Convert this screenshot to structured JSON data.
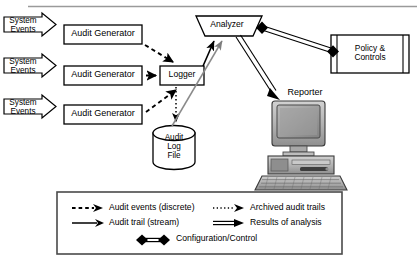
{
  "figure": {
    "type": "block-diagram"
  },
  "nodes": {
    "system_events": [
      {
        "label": "System\nEvents",
        "shape": "arrow-pentagon"
      },
      {
        "label": "System\nEvents",
        "shape": "arrow-pentagon"
      },
      {
        "label": "System\nEvents",
        "shape": "arrow-pentagon"
      }
    ],
    "audit_generators": [
      {
        "label": "Audit Generator",
        "shape": "rectangle"
      },
      {
        "label": "Audit Generator",
        "shape": "rectangle"
      },
      {
        "label": "Audit Generator",
        "shape": "rectangle"
      }
    ],
    "logger": {
      "label": "Logger",
      "shape": "rectangle"
    },
    "analyzer": {
      "label": "Analyzer",
      "shape": "inverted-trapezoid"
    },
    "policy_controls": {
      "label": "Policy &\nControls",
      "shape": "component-node"
    },
    "audit_log_file": {
      "label": "Audit\nLog\nFile",
      "shape": "cylinder"
    },
    "reporter": {
      "label": "Reporter",
      "shape": "workstation-icon"
    }
  },
  "legend": {
    "entries": [
      {
        "label": "Audit events (discrete)",
        "line": "dashed",
        "arrow": "single"
      },
      {
        "label": "Archived audit trails",
        "line": "dotted",
        "arrow": "single"
      },
      {
        "label": "Audit trail (stream)",
        "line": "solid-thin",
        "arrow": "single"
      },
      {
        "label": "Results of analysis",
        "line": "solid-double",
        "arrow": "single"
      },
      {
        "label": "Configuration/Control",
        "line": "solid-double",
        "arrow": "diamond-both"
      }
    ]
  },
  "colors": {
    "stroke": "#000000",
    "fill": "#ffffff",
    "gray_line": "#8a8a8a",
    "monitor_screen": "#9a9a9a",
    "case_gray": "#b4b4b4",
    "rule": "#9a9a9a"
  }
}
